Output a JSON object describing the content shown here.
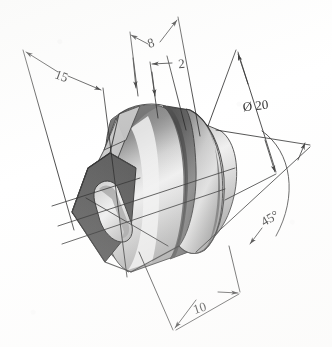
{
  "drawing": {
    "type": "isometric-technical-drawing",
    "title": "Dimensioned isometric view of cylindrical bushing with groove and slotted end face",
    "background_color": "#ffffff",
    "line_color": "#2b2b2b",
    "part": {
      "name": "cylindrical-bushing",
      "features": [
        "cylindrical body",
        "circumferential groove",
        "rounded right end",
        "chamfered hexagonal left end face",
        "oblong slot hole"
      ],
      "shading": {
        "dark_face": "#595959",
        "mid_face": "#8c8c8c",
        "light_face": "#d9d9d9",
        "highlight": "#f2f2f2",
        "groove": "#6b6b6b",
        "outline": "#3a3a3a"
      }
    },
    "dimensions": [
      {
        "id": "dim-15",
        "label": "15",
        "value": 15,
        "unit": "mm",
        "kind": "linear",
        "position": "upper-left",
        "description": "overall length along axis"
      },
      {
        "id": "dim-8",
        "label": "8",
        "value": 8,
        "unit": "mm",
        "kind": "linear",
        "position": "top-left",
        "description": "distance to groove near face"
      },
      {
        "id": "dim-2",
        "label": "2",
        "value": 2,
        "unit": "mm",
        "kind": "linear",
        "position": "top-center",
        "description": "groove width"
      },
      {
        "id": "dim-diameter-20",
        "label": "Ø 20",
        "value": 20,
        "unit": "mm",
        "kind": "diameter",
        "symbol": "Ø",
        "position": "upper-right",
        "description": "outer cylinder diameter"
      },
      {
        "id": "dim-10",
        "label": "10",
        "value": 10,
        "unit": "mm",
        "kind": "linear",
        "position": "bottom-center",
        "description": "slot / feature length"
      },
      {
        "id": "dim-45-deg",
        "label": "45°",
        "value": 45,
        "unit": "deg",
        "kind": "angular",
        "symbol": "°",
        "position": "right",
        "description": "chamfer angle of end face"
      }
    ]
  }
}
